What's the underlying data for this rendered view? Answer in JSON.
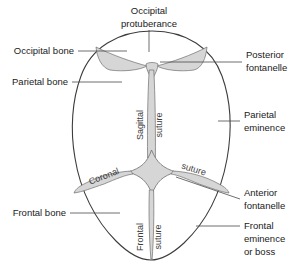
{
  "diagram": {
    "colors": {
      "outline": "#3c3c3c",
      "suture_fill": "#d6d6d6",
      "suture_stroke": "#6e6e6e",
      "leader": "#4a4a4a",
      "text": "#1a1a1a",
      "background": "#ffffff"
    },
    "labels": {
      "occipital_protuberance_line1": "Occipital",
      "occipital_protuberance_line2": "protuberance",
      "occipital_bone": "Occipital bone",
      "parietal_bone": "Parietal bone",
      "frontal_bone": "Frontal bone",
      "posterior_fontanelle_line1": "Posterior",
      "posterior_fontanelle_line2": "fontanelle",
      "parietal_eminence_line1": "Parietal",
      "parietal_eminence_line2": "eminence",
      "anterior_fontanelle_line1": "Anterior",
      "anterior_fontanelle_line2": "fontanelle",
      "frontal_eminence_line1": "Frontal",
      "frontal_eminence_line2": "eminence",
      "frontal_eminence_line3": "or boss",
      "sagittal_suture_word1": "Sagittal",
      "sagittal_suture_word2": "suture",
      "coronal_suture_word1": "Coronal",
      "coronal_suture_word2": "suture",
      "frontal_suture_word1": "Frontal",
      "frontal_suture_word2": "suture"
    }
  }
}
